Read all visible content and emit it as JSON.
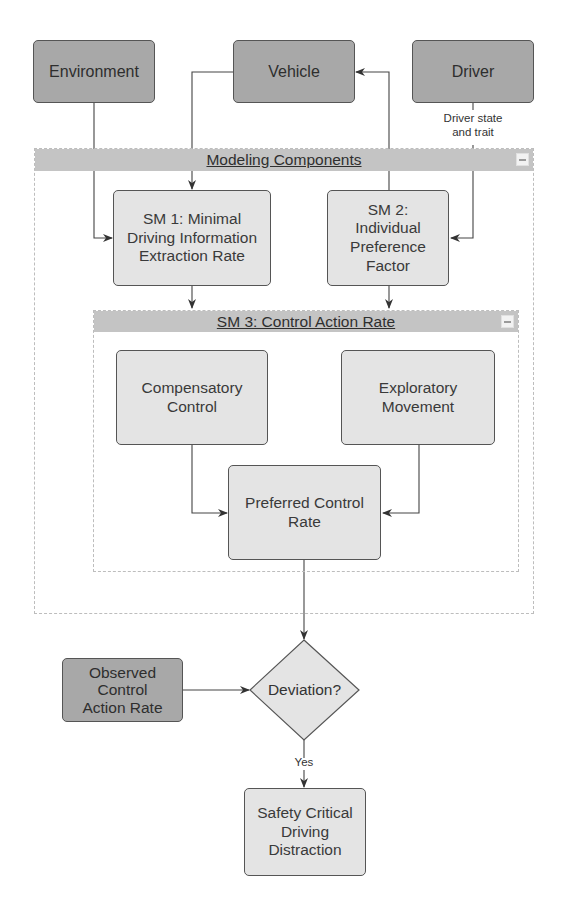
{
  "diagram": {
    "type": "flowchart",
    "inputs": {
      "environment": "Environment",
      "vehicle": "Vehicle",
      "driver": "Driver",
      "driver_edge_label": "Driver state\nand trait"
    },
    "modeling_components": {
      "title": "Modeling Components",
      "sm1": "SM 1: Minimal\nDriving Information\nExtraction Rate",
      "sm2": "SM 2:\nIndividual\nPreference\nFactor",
      "sm3": {
        "title": "SM 3: Control Action Rate",
        "compensatory": "Compensatory\nControl",
        "exploratory": "Exploratory\nMovement",
        "preferred": "Preferred Control\nRate"
      }
    },
    "observed": "Observed\nControl\nAction Rate",
    "decision": "Deviation?",
    "decision_yes_label": "Yes",
    "outcome": "Safety Critical\nDriving\nDistraction",
    "colors": {
      "input_fill": "#a8a8a8",
      "module_fill": "#e4e4e4",
      "header_fill": "#c4c4c4",
      "stroke": "#555555"
    }
  }
}
